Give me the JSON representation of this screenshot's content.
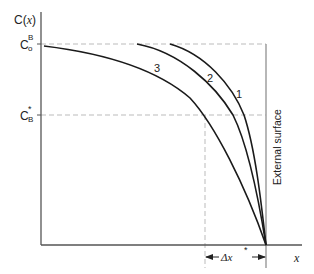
{
  "diagram": {
    "y_axis_label": "C(x)",
    "y_axis_label_parts": {
      "main": "C(",
      "var": "x",
      "close": ")"
    },
    "x_axis_label": "x",
    "levels": {
      "top": {
        "label_main": "C",
        "label_sup": "B",
        "label_sub": "o"
      },
      "mid": {
        "label_main": "C",
        "label_sup": "*",
        "label_sub": "B"
      }
    },
    "delta_label": {
      "main": "Δx",
      "sup": "*"
    },
    "external_surface_label": "External surface",
    "curves": [
      {
        "id": "1",
        "label": "1"
      },
      {
        "id": "2",
        "label": "2"
      },
      {
        "id": "3",
        "label": "3"
      }
    ],
    "colors": {
      "curve": "#1a1a1a",
      "axis": "#555555",
      "dashed": "#bbbbbb",
      "surface_line": "#999999"
    }
  }
}
